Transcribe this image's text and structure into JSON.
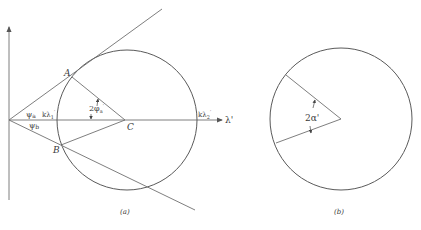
{
  "figure": {
    "panel_a": {
      "caption": "(a)",
      "points": {
        "A": "A",
        "B": "B",
        "C": "C"
      },
      "angle_labels": {
        "psi_a": "ψa",
        "psi_b": "ψb",
        "two_phi_a": "2φ'a"
      },
      "axis_label": "λ'",
      "k_lambda_1": "kλ'1",
      "k_lambda_2": "kλ'2"
    },
    "panel_b": {
      "caption": "(b)",
      "angle_label": "2α'"
    }
  },
  "colors": {
    "line": "#6f6f6f",
    "circle": "#5a5a5a",
    "text": "#3a3a3a",
    "background": "#ffffff"
  }
}
